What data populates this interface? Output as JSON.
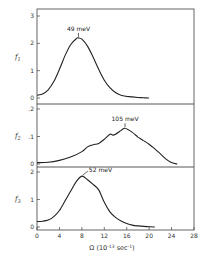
{
  "chart_data": {
    "type": "line",
    "layout": "three vertically stacked panels sharing x-axis",
    "xlabel": "Ω (10^-13 sec^-1)",
    "xlabel_parts": {
      "base": "Ω (10",
      "exp": "-13",
      "unit": " sec",
      "unit_exp": "-1",
      "close": ")"
    },
    "xlim": [
      0,
      28
    ],
    "xticks": [
      0,
      4,
      8,
      12,
      16,
      20,
      24,
      28
    ],
    "xtick_labels": [
      "0",
      "4",
      "8",
      "12",
      "16",
      "20",
      "24",
      "28"
    ],
    "grid": false,
    "panels": [
      {
        "ylabel": "f1",
        "ylabel_base": "f",
        "ylabel_sub": "1",
        "ylim": [
          0,
          3
        ],
        "yticks": [
          0,
          1,
          2,
          3
        ],
        "ytick_labels": [
          "0",
          "1",
          "2",
          "3"
        ],
        "annotation": {
          "text": "49 meV",
          "x": 7.4,
          "y": 2.2
        },
        "series": {
          "x": [
            0,
            1,
            2,
            3,
            4,
            5,
            6,
            7,
            7.4,
            8,
            9,
            10,
            11,
            12,
            13,
            14,
            15,
            16,
            17,
            18,
            19,
            20
          ],
          "y": [
            0.1,
            0.15,
            0.3,
            0.6,
            1.05,
            1.55,
            1.95,
            2.17,
            2.2,
            2.15,
            1.9,
            1.5,
            1.05,
            0.65,
            0.38,
            0.2,
            0.1,
            0.06,
            0.04,
            0.02,
            0.01,
            0.0
          ]
        }
      },
      {
        "ylabel": "f2",
        "ylabel_base": "f",
        "ylabel_sub": "2",
        "ylim": [
          0,
          0.2
        ],
        "yticks": [
          0,
          0.1,
          0.2
        ],
        "ytick_labels": [
          "0",
          ".1",
          ".2"
        ],
        "annotation": {
          "text": "105 meV",
          "x": 15.7,
          "y": 0.13
        },
        "series": {
          "x": [
            0,
            2,
            4,
            6,
            8,
            9,
            10,
            11,
            12,
            13,
            13.5,
            14,
            15,
            15.7,
            17,
            18,
            19,
            20,
            21,
            22,
            23,
            24,
            25
          ],
          "y": [
            0.005,
            0.006,
            0.013,
            0.025,
            0.045,
            0.062,
            0.07,
            0.075,
            0.09,
            0.108,
            0.105,
            0.108,
            0.122,
            0.13,
            0.115,
            0.098,
            0.085,
            0.072,
            0.055,
            0.037,
            0.018,
            0.005,
            0.0
          ]
        }
      },
      {
        "ylabel": "f3",
        "ylabel_base": "f",
        "ylabel_sub": "3",
        "ylim": [
          0,
          2
        ],
        "yticks": [
          0,
          1,
          2
        ],
        "ytick_labels": [
          "0",
          "1",
          "2"
        ],
        "annotation": {
          "text": "52 meV",
          "x": 8,
          "y": 1.85
        },
        "series": {
          "x": [
            0,
            1,
            2,
            3,
            4,
            5,
            6,
            7,
            8,
            9,
            10,
            11,
            12,
            13,
            14,
            15,
            16,
            17,
            18,
            19,
            20,
            21
          ],
          "y": [
            0.2,
            0.21,
            0.25,
            0.38,
            0.6,
            0.95,
            1.3,
            1.65,
            1.85,
            1.72,
            1.55,
            1.35,
            0.9,
            0.55,
            0.35,
            0.22,
            0.13,
            0.07,
            0.04,
            0.02,
            0.01,
            0.0
          ]
        }
      }
    ]
  }
}
